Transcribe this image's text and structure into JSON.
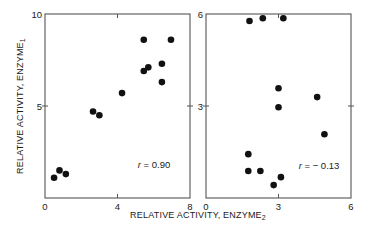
{
  "chart_data": [
    {
      "type": "scatter",
      "title": "",
      "xlabel": "RELATIVE ACTIVITY, ENZYME2",
      "ylabel": "RELATIVE ACTIVITY, ENZYME1",
      "xlim": [
        0,
        8
      ],
      "ylim": [
        0,
        10
      ],
      "x_ticks": [
        0,
        4,
        8
      ],
      "x_tick_labels": [
        "0",
        "4",
        "8"
      ],
      "y_ticks": [
        0,
        5,
        10
      ],
      "y_tick_labels": [
        "",
        "5",
        "10"
      ],
      "grid": false,
      "annotation": "r = 0.90",
      "points": [
        {
          "x": 0.5,
          "y": 1.1
        },
        {
          "x": 0.8,
          "y": 1.5
        },
        {
          "x": 1.15,
          "y": 1.3
        },
        {
          "x": 2.65,
          "y": 4.7
        },
        {
          "x": 3.0,
          "y": 4.5
        },
        {
          "x": 4.25,
          "y": 5.7
        },
        {
          "x": 5.45,
          "y": 6.9
        },
        {
          "x": 5.7,
          "y": 7.1
        },
        {
          "x": 5.45,
          "y": 8.6
        },
        {
          "x": 6.45,
          "y": 7.3
        },
        {
          "x": 6.45,
          "y": 6.3
        },
        {
          "x": 6.95,
          "y": 8.6
        }
      ]
    },
    {
      "type": "scatter",
      "title": "",
      "xlabel": "RELATIVE ACTIVITY, ENZYME2",
      "ylabel": "",
      "xlim": [
        0,
        6
      ],
      "ylim": [
        0,
        6
      ],
      "x_ticks": [
        0,
        3,
        6
      ],
      "x_tick_labels": [
        "0",
        "3",
        "6"
      ],
      "y_ticks": [
        0,
        3,
        6
      ],
      "y_tick_labels": [
        "",
        "3",
        "6"
      ],
      "grid": false,
      "annotation": "r = −0.13",
      "points": [
        {
          "x": 1.8,
          "y": 5.77
        },
        {
          "x": 2.35,
          "y": 5.86
        },
        {
          "x": 3.2,
          "y": 5.86
        },
        {
          "x": 3.0,
          "y": 3.58
        },
        {
          "x": 4.6,
          "y": 3.29
        },
        {
          "x": 3.0,
          "y": 2.96
        },
        {
          "x": 4.9,
          "y": 2.08
        },
        {
          "x": 1.75,
          "y": 1.43
        },
        {
          "x": 1.75,
          "y": 0.88
        },
        {
          "x": 2.25,
          "y": 0.88
        },
        {
          "x": 3.1,
          "y": 0.68
        },
        {
          "x": 2.8,
          "y": 0.42
        }
      ]
    }
  ],
  "labels": {
    "y_axis_title_main": "RELATIVE ACTIVITY, ENZYME",
    "y_axis_title_sub": "1",
    "x_axis_title_main": "RELATIVE ACTIVITY, ENZYME",
    "x_axis_title_sub": "2",
    "left_r_symbol": "r",
    "left_r_value": " = 0.90",
    "right_r_symbol": "r",
    "right_r_value": " = − 0.13"
  }
}
